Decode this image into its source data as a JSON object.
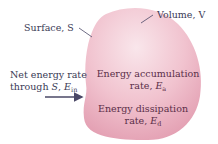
{
  "diagram": {
    "colors": {
      "blob_fill_light": "#f7dde4",
      "blob_fill_mid": "#eeb4c3",
      "blob_edge": "#e39fb2",
      "arrow": "#4a4866",
      "text": "#3a3a55"
    },
    "labels": {
      "surface": "Surface, S",
      "volume": "Volume, V",
      "net_energy_line1": "Net energy rate",
      "net_energy_line2_prefix": "through ",
      "net_energy_S": "S",
      "net_energy_sep": ", ",
      "net_energy_E": "E",
      "net_energy_sub": "in",
      "accumulation_line1": "Energy accumulation",
      "accumulation_line2_prefix": "rate, ",
      "accumulation_E": "E",
      "accumulation_sub": "a",
      "dissipation_line1": "Energy dissipation",
      "dissipation_line2_prefix": "rate, ",
      "dissipation_E": "E",
      "dissipation_sub": "d"
    }
  }
}
